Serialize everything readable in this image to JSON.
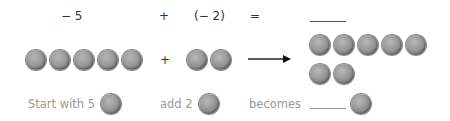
{
  "equation": {
    "term1": "− 5",
    "plus": "+",
    "term2": "(− 2)",
    "equals": "=",
    "result_blank": ""
  },
  "counters": {
    "group1_count": 5,
    "group2_count": 2,
    "result_count": 7,
    "plus": "+",
    "arrow": "right-arrow-icon"
  },
  "captions": {
    "start": "Start with 5",
    "add": "add 2",
    "becomes": "becomes"
  }
}
